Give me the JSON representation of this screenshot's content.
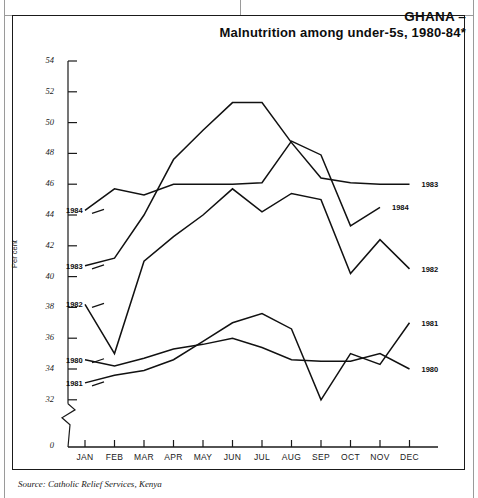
{
  "title": {
    "line1": "GHANA –",
    "line2": "Malnutrition among under-5s, 1980-84*"
  },
  "source": "Source: Catholic Relief Services, Kenya",
  "axis": {
    "y_title": "Per cent",
    "y_ticks": [
      "54",
      "52",
      "50",
      "48",
      "46",
      "44",
      "42",
      "40",
      "38",
      "36",
      "34",
      "32"
    ],
    "y_zero": "0",
    "x_ticks": [
      "JAN",
      "FEB",
      "MAR",
      "APR",
      "MAY",
      "JUN",
      "JUL",
      "AUG",
      "SEP",
      "OCT",
      "NOV",
      "DEC"
    ]
  },
  "left_labels": [
    {
      "text": "1984",
      "value": 44.3
    },
    {
      "text": "1983",
      "value": 40.7
    },
    {
      "text": "1982",
      "value": 38.2
    },
    {
      "text": "1980",
      "value": 34.6
    },
    {
      "text": "1981",
      "value": 33.1
    }
  ],
  "right_labels": [
    {
      "text": "1983",
      "value": 46.0
    },
    {
      "text": "1984",
      "value": 44.5,
      "month_index": 10
    },
    {
      "text": "1982",
      "value": 40.5
    },
    {
      "text": "1981",
      "value": 37.0
    },
    {
      "text": "1980",
      "value": 34.0
    }
  ],
  "chart_data": {
    "type": "line",
    "title": "GHANA – Malnutrition among under-5s, 1980-84*",
    "xlabel": "",
    "ylabel": "Per cent",
    "categories": [
      "JAN",
      "FEB",
      "MAR",
      "APR",
      "MAY",
      "JUN",
      "JUL",
      "AUG",
      "SEP",
      "OCT",
      "NOV",
      "DEC"
    ],
    "ylim": [
      32,
      54
    ],
    "y_axis_break": true,
    "grid": false,
    "legend": "inline-end-labels",
    "series": [
      {
        "name": "1980",
        "values": [
          34.6,
          34.2,
          34.7,
          35.3,
          35.6,
          36.0,
          35.4,
          34.6,
          34.5,
          34.5,
          35.0,
          34.0
        ]
      },
      {
        "name": "1981",
        "values": [
          33.1,
          33.6,
          33.9,
          34.6,
          35.8,
          37.0,
          37.6,
          36.6,
          32.0,
          35.0,
          34.3,
          37.0
        ]
      },
      {
        "name": "1982",
        "values": [
          38.2,
          35.0,
          41.0,
          42.6,
          44.0,
          45.7,
          44.2,
          45.4,
          45.0,
          40.2,
          42.4,
          40.5
        ]
      },
      {
        "name": "1983",
        "values": [
          40.7,
          41.2,
          44.0,
          47.6,
          49.5,
          51.3,
          51.3,
          48.7,
          46.4,
          46.1,
          46.0,
          46.0
        ]
      },
      {
        "name": "1984",
        "values": [
          44.3,
          45.7,
          45.3,
          46.0,
          46.0,
          46.0,
          46.1,
          48.8,
          47.9,
          43.3,
          44.5,
          null
        ]
      }
    ]
  }
}
